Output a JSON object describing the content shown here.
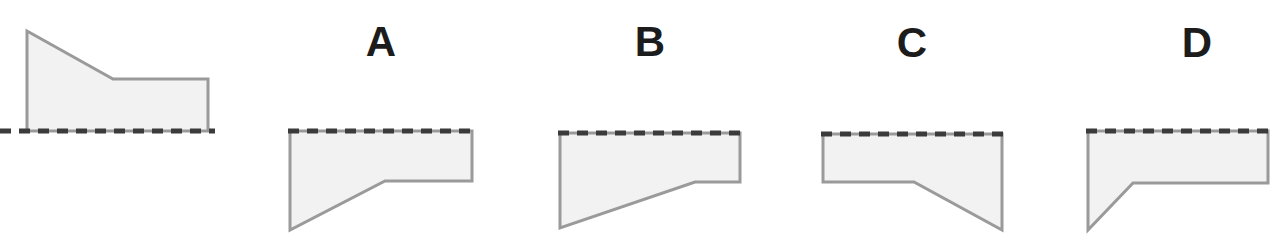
{
  "page": {
    "background_color": "#ffffff",
    "width": 1283,
    "height": 251
  },
  "style": {
    "shape_fill": "#f2f2f2",
    "shape_stroke": "#9a9a9a",
    "shape_stroke_width": 3,
    "dash_color": "#3b3b3b",
    "dash_width": 5,
    "dash_pattern": "11 8",
    "letter_color": "#1c1c1c",
    "letter_font_size": 42
  },
  "prompt_figure": {
    "name": "reference-shape",
    "description": "Quadrilateral sitting on a dashed mirror line, tall left edge sloping down to a lower flat top-right section",
    "polygon_points": "27,31 113,79 208,79 208,131 27,131",
    "dash_line": {
      "x1": 0,
      "y1": 131,
      "x2": 215,
      "y2": 131
    }
  },
  "options": [
    {
      "id": "A",
      "label": "A",
      "letter_x": 381,
      "letter_y": 42,
      "description": "Reflection across a horizontal mirror line: tall left edge, diagonal rising to the right, flat lower-right section",
      "polygon_points": "290,131 290,230 385,181 472,181 472,131",
      "dash_line": {
        "x1": 288,
        "y1": 131,
        "x2": 474,
        "y2": 131
      }
    },
    {
      "id": "B",
      "label": "B",
      "letter_x": 650,
      "letter_y": 42,
      "description": "Similar to A but the diagonal extends further right, leaving a short flat segment at the right",
      "polygon_points": "560,133 560,228 695,182 740,182 740,133",
      "dash_line": {
        "x1": 558,
        "y1": 133,
        "x2": 742,
        "y2": 133
      }
    },
    {
      "id": "C",
      "label": "C",
      "letter_x": 912,
      "letter_y": 43,
      "description": "Mirrored left-to-right: short left edge, flat section then diagonal dropping to a deep right corner",
      "polygon_points": "823,134 823,182 914,182 1002,230 1002,134",
      "dash_line": {
        "x1": 821,
        "y1": 134,
        "x2": 1004,
        "y2": 134
      }
    },
    {
      "id": "D",
      "label": "D",
      "letter_x": 1197,
      "letter_y": 43,
      "description": "Deep left corner with a short diagonal rising to a long flat section running to the right",
      "polygon_points": "1088,131 1088,230 1133,183 1268,183 1268,131",
      "dash_line": {
        "x1": 1086,
        "y1": 131,
        "x2": 1270,
        "y2": 131
      }
    }
  ]
}
